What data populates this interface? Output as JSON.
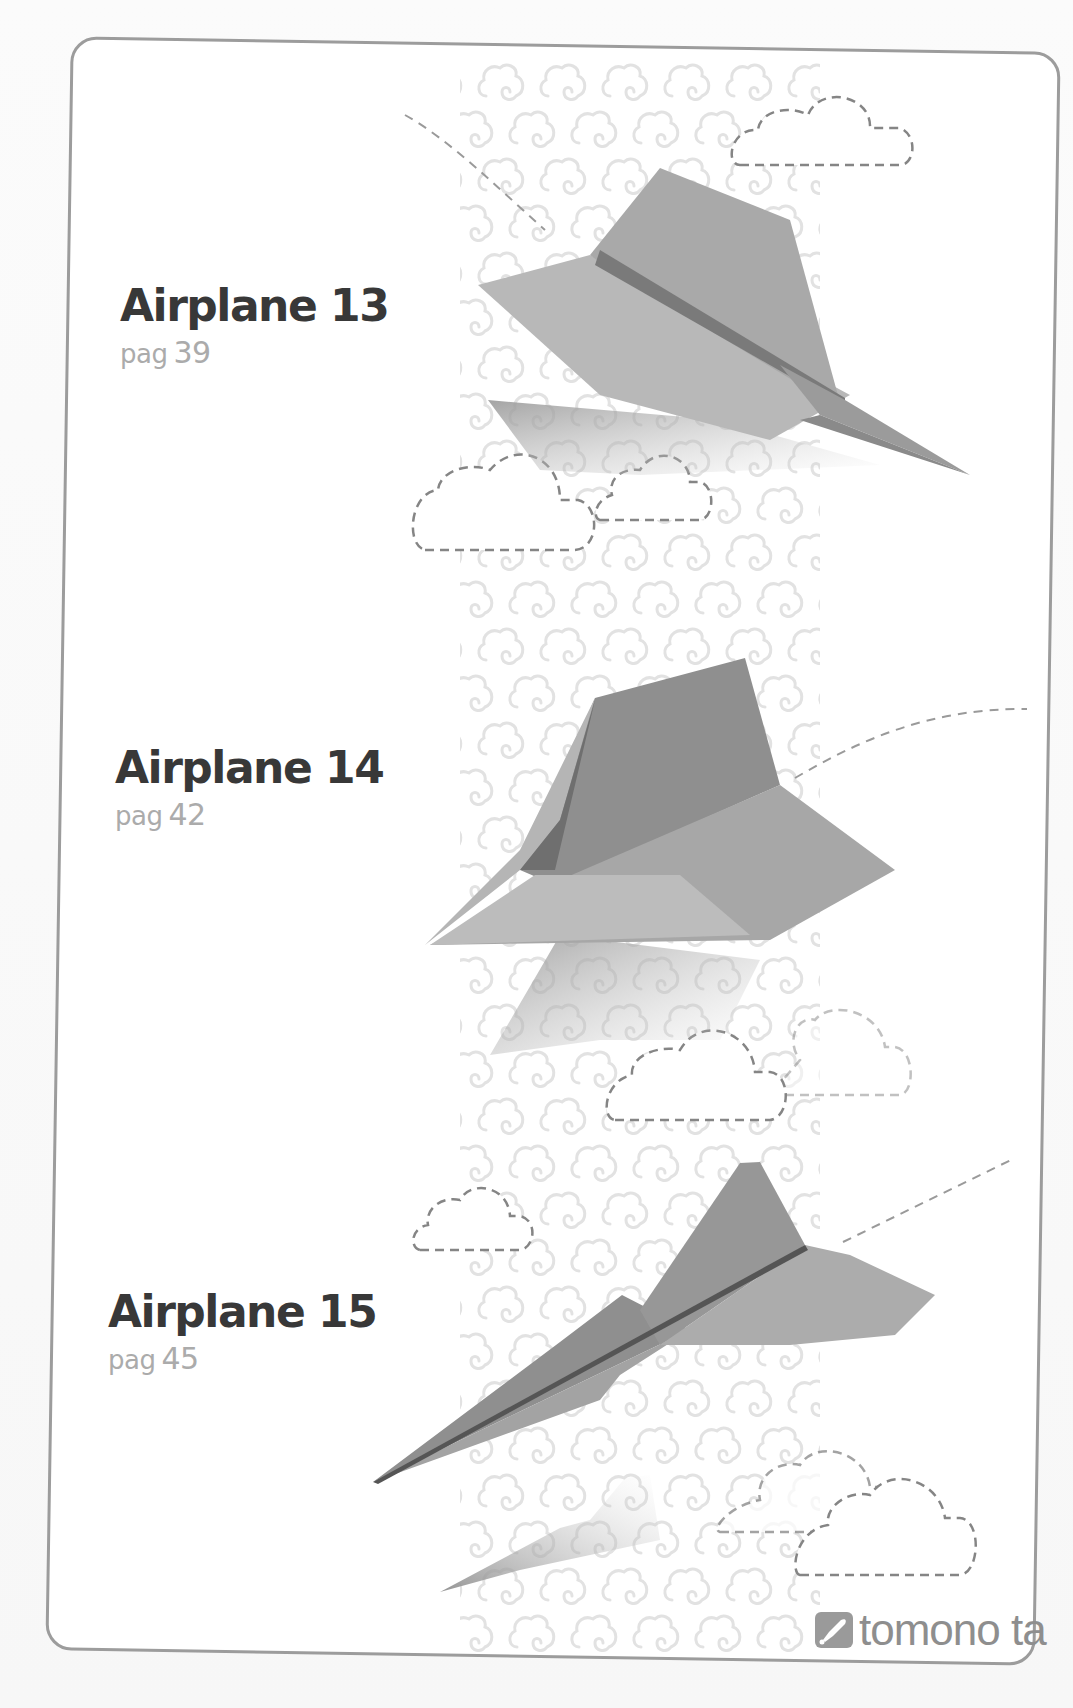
{
  "page": {
    "entries": [
      {
        "title": "Airplane 13",
        "page_prefix": "pag",
        "page_number": "39"
      },
      {
        "title": "Airplane 14",
        "page_prefix": "pag",
        "page_number": "42"
      },
      {
        "title": "Airplane 15",
        "page_prefix": "pag",
        "page_number": "45"
      }
    ],
    "brand": {
      "name": "tomono ta",
      "icon": "rocket-logo-icon"
    }
  },
  "colors": {
    "frame_border": "#9c9c9c",
    "title_text": "#383838",
    "page_text": "#ababab",
    "pattern": "#e4e4e4",
    "cloud_dash": "#8a8a8a",
    "plane_mid": "#a6a6a6"
  }
}
